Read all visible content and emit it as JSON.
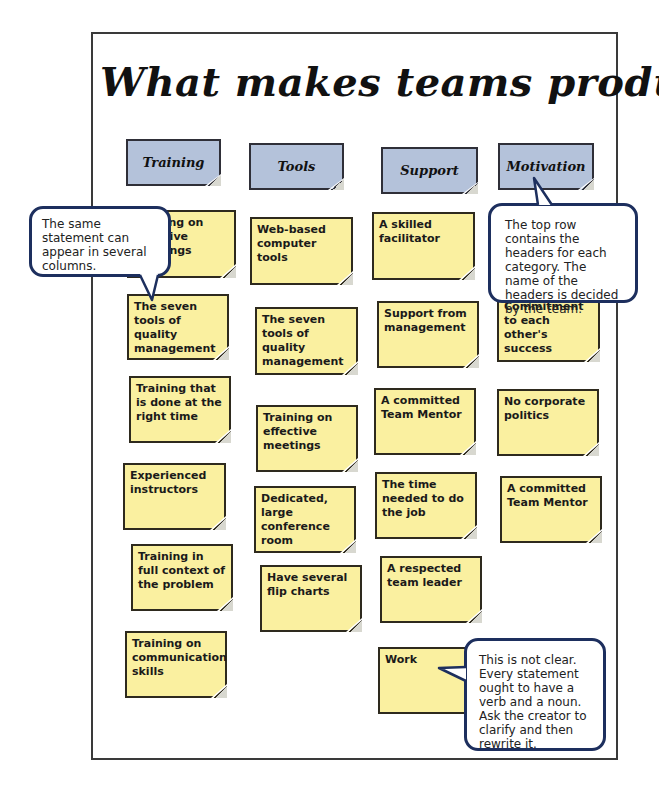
{
  "title": "What makes teams productive?",
  "colors": {
    "sticky_note": "#faf0a0",
    "header_note": "#b4c2da",
    "callout_border": "#1d2f5e",
    "frame_border": "#3a3a3a"
  },
  "headers": [
    {
      "label": "Training"
    },
    {
      "label": "Tools"
    },
    {
      "label": "Support"
    },
    {
      "label": "Motivation"
    }
  ],
  "columns": {
    "training": [
      "Training on effective meetings",
      "The seven tools of quality management",
      "Training that is done at the right time",
      "Experienced instructors",
      "Training in full context of the problem",
      "Training on communication skills"
    ],
    "tools": [
      "Web-based computer tools",
      "The seven tools of quality management",
      "Training on effective meetings",
      "Dedicated, large conference room",
      "Have several flip charts"
    ],
    "support": [
      "A skilled facilitator",
      "Support from management",
      "A committed Team Mentor",
      "The time needed to do the job",
      "A respected team leader",
      "Work"
    ],
    "motivation": [
      "Commitment to each other's success",
      "No corporate politics",
      "A committed Team Mentor"
    ]
  },
  "callouts": {
    "same_statement": "The same statement can appear in several columns.",
    "top_row": "The top row contains the headers for each category. The name of the headers is decided by the team.",
    "not_clear": "This is not clear. Every statement ought to have a verb and a noun. Ask the creator to clarify and then rewrite it."
  }
}
